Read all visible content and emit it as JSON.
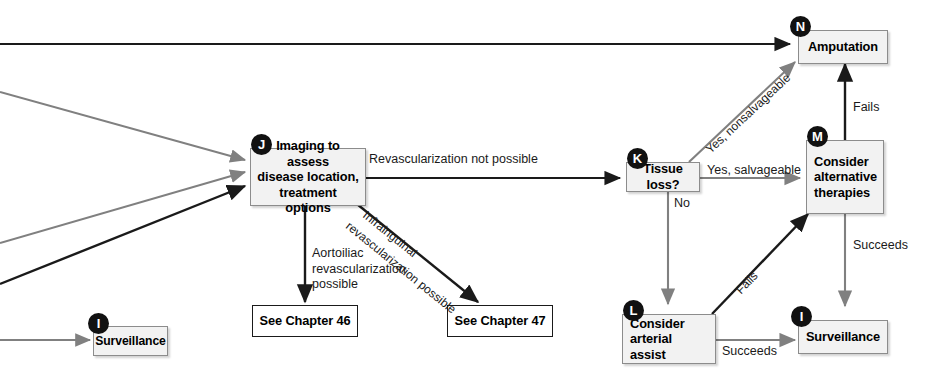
{
  "diagram": {
    "type": "clinical-algorithm-flowchart",
    "colors": {
      "box_fill": "#f2f2f2",
      "box_border": "#8c8c8c",
      "plain_box_border": "#1a1a1a",
      "badge_fill": "#111111",
      "badge_text": "#ffffff",
      "arrow_black": "#1a1a1a",
      "arrow_gray": "#808080",
      "text": "#1a1a1a",
      "background": "#ffffff"
    },
    "nodes": [
      {
        "id": "J",
        "badge": "J",
        "label": "Imaging to assess disease location, treatment options",
        "lines": [
          "Imaging to assess",
          "disease location,",
          "treatment options"
        ]
      },
      {
        "id": "K",
        "badge": "K",
        "label": "Tissue loss?",
        "lines": [
          "Tissue loss?"
        ]
      },
      {
        "id": "N",
        "badge": "N",
        "label": "Amputation",
        "lines": [
          "Amputation"
        ]
      },
      {
        "id": "M",
        "badge": "M",
        "label": "Consider alternative therapies",
        "lines": [
          "Consider",
          "alternative",
          "therapies"
        ]
      },
      {
        "id": "L",
        "badge": "L",
        "label": "Consider arterial assist",
        "lines": [
          "Consider",
          "arterial assist"
        ]
      },
      {
        "id": "I-right",
        "badge": "I",
        "label": "Surveillance",
        "lines": [
          "Surveillance"
        ]
      },
      {
        "id": "I-left",
        "badge": "I",
        "label": "Surveillance",
        "lines": [
          "Surveillance"
        ]
      },
      {
        "id": "chapter46",
        "badge": "",
        "label": "See Chapter 46",
        "lines": [
          "See Chapter 46"
        ]
      },
      {
        "id": "chapter47",
        "badge": "",
        "label": "See Chapter 47",
        "lines": [
          "See Chapter 47"
        ]
      }
    ],
    "edge_labels": {
      "revascularization_not_possible": "Revascularization not possible",
      "aortoiliac_revascularization_possible": "Aortoiliac revascularization possible",
      "infrainguinal_line1": "Infrainguinal",
      "infrainguinal_line2": "revascularization possible",
      "yes_nonsalvageable": "Yes, nonsalvageable",
      "yes_salvageable": "Yes, salvageable",
      "no": "No",
      "fails_m_to_n": "Fails",
      "fails_l_to_m": "Fails",
      "succeeds_m_to_i": "Succeeds",
      "succeeds_l_to_i": "Succeeds"
    },
    "edges": [
      {
        "from": "offscreen-left",
        "to": "N",
        "style": "black",
        "label": ""
      },
      {
        "from": "offscreen-left",
        "to": "J",
        "style": "gray",
        "label": ""
      },
      {
        "from": "offscreen-left",
        "to": "J",
        "style": "gray",
        "label": ""
      },
      {
        "from": "offscreen-left",
        "to": "J",
        "style": "black",
        "label": ""
      },
      {
        "from": "J",
        "to": "K",
        "style": "black",
        "label": "Revascularization not possible"
      },
      {
        "from": "J",
        "to": "chapter46",
        "style": "black",
        "label": "Aortoiliac revascularization possible"
      },
      {
        "from": "J",
        "to": "chapter47",
        "style": "black",
        "label": "Infrainguinal revascularization possible"
      },
      {
        "from": "K",
        "to": "N",
        "style": "gray",
        "label": "Yes, nonsalvageable"
      },
      {
        "from": "K",
        "to": "M",
        "style": "gray",
        "label": "Yes, salvageable"
      },
      {
        "from": "K",
        "to": "L",
        "style": "gray",
        "label": "No"
      },
      {
        "from": "M",
        "to": "N",
        "style": "black",
        "label": "Fails"
      },
      {
        "from": "M",
        "to": "I-right",
        "style": "gray",
        "label": "Succeeds"
      },
      {
        "from": "L",
        "to": "M",
        "style": "black",
        "label": "Fails"
      },
      {
        "from": "L",
        "to": "I-right",
        "style": "gray",
        "label": "Succeeds"
      },
      {
        "from": "offscreen-left",
        "to": "I-left",
        "style": "gray",
        "label": ""
      }
    ]
  }
}
